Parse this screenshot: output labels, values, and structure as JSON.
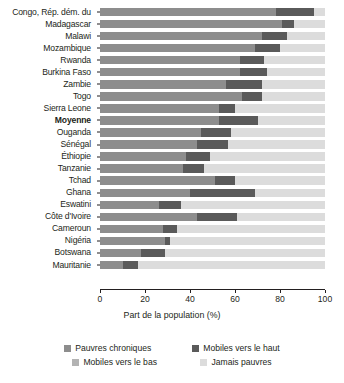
{
  "chart_data": {
    "type": "bar",
    "orientation": "horizontal",
    "stacked": true,
    "title": "",
    "subtitle": "",
    "xlabel": "Part de la population (%)",
    "ylabel": "",
    "xlim": [
      0,
      100
    ],
    "xticks": [
      0,
      20,
      40,
      60,
      80,
      100
    ],
    "xticklabels": [
      "0",
      "20",
      "40",
      "60",
      "80",
      "100"
    ],
    "grid": false,
    "legend_position": "bottom",
    "categories": [
      "Congo, Rép. dém. du",
      "Madagascar",
      "Malawi",
      "Mozambique",
      "Rwanda",
      "Burkina Faso",
      "Zambie",
      "Togo",
      "Sierra Leone",
      "Moyenne",
      "Ouganda",
      "Sénégal",
      "Éthiopie",
      "Tanzanie",
      "Tchad",
      "Ghana",
      "Eswatini",
      "Côte d'Ivoire",
      "Cameroun",
      "Nigéria",
      "Botswana",
      "Mauritanie"
    ],
    "highlight_category": "Moyenne",
    "series": [
      {
        "name": "Pauvres chroniques",
        "color": "#8d8d8d",
        "values": [
          78,
          81,
          72,
          69,
          62,
          62,
          56,
          63,
          53,
          53,
          45,
          43,
          38,
          37,
          51,
          40,
          26,
          43,
          28,
          29,
          18,
          10
        ]
      },
      {
        "name": "Mobiles vers le haut",
        "color": "#5a5a5a",
        "values": [
          17,
          5,
          11,
          11,
          11,
          12,
          16,
          9,
          7,
          17,
          13,
          14,
          11,
          9,
          9,
          29,
          10,
          18,
          6,
          2,
          11,
          7
        ]
      },
      {
        "name": "Mobiles vers le bas",
        "color": "#b3b3b3",
        "values": [
          0,
          0,
          0,
          0,
          0,
          0,
          0,
          0,
          0,
          0,
          0,
          0,
          0,
          0,
          0,
          0,
          0,
          0,
          0,
          0,
          0,
          0
        ]
      },
      {
        "name": "Jamais pauvres",
        "color": "#dcdcdc",
        "values": [
          5,
          14,
          17,
          20,
          27,
          26,
          28,
          28,
          40,
          30,
          42,
          43,
          51,
          54,
          40,
          31,
          64,
          39,
          66,
          69,
          71,
          83
        ]
      }
    ]
  },
  "axis": {
    "xlabel": "Part de la population (%)",
    "ticks": [
      "0",
      "20",
      "40",
      "60",
      "80",
      "100"
    ]
  },
  "legend": {
    "items": [
      {
        "label": "Pauvres chroniques",
        "color": "#8d8d8d"
      },
      {
        "label": "Mobiles vers le haut",
        "color": "#5a5a5a"
      },
      {
        "label": "Mobiles vers le bas",
        "color": "#b3b3b3"
      },
      {
        "label": "Jamais pauvres",
        "color": "#dcdcdc"
      }
    ]
  }
}
